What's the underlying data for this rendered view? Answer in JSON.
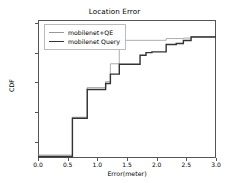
{
  "chart_data": {
    "type": "line",
    "title": "Location Error",
    "xlabel": "Error(meter)",
    "ylabel": "CDF",
    "xlim": [
      0.0,
      3.0
    ],
    "ylim": [
      0.09,
      1.02
    ],
    "grid": false,
    "legend_position": "upper left",
    "xticks": [
      "0.0",
      "0.5",
      "1.0",
      "1.5",
      "2.0",
      "2.5",
      "3.0"
    ],
    "xtick_values": [
      0.0,
      0.5,
      1.0,
      1.5,
      2.0,
      2.5,
      3.0
    ],
    "yticks": [
      "0.2",
      "0.4",
      "0.6",
      "0.8",
      "1.0"
    ],
    "ytick_values": [
      0.2,
      0.4,
      0.6,
      0.8,
      1.0
    ],
    "series": [
      {
        "name": "mobilenet+QE",
        "color": "#999999",
        "linewidth": 0.8,
        "step": "post",
        "x": [
          0.0,
          0.58,
          0.83,
          1.14,
          1.22,
          1.37,
          2.16,
          2.45,
          2.58,
          3.0
        ],
        "y": [
          0.11,
          0.365,
          0.565,
          0.605,
          0.725,
          0.883,
          0.895,
          0.898,
          0.908,
          0.912
        ]
      },
      {
        "name": "mobilenet Query",
        "color": "#333333",
        "linewidth": 1.4,
        "step": "post",
        "x": [
          0.0,
          0.58,
          0.83,
          1.14,
          1.22,
          1.37,
          1.72,
          1.82,
          1.92,
          2.16,
          2.33,
          2.45,
          2.58,
          3.0
        ],
        "y": [
          0.1,
          0.358,
          0.552,
          0.592,
          0.655,
          0.722,
          0.782,
          0.8,
          0.805,
          0.855,
          0.862,
          0.882,
          0.905,
          0.912
        ]
      }
    ]
  },
  "legend": {
    "entries": [
      {
        "label": "mobilenet+QE"
      },
      {
        "label": "mobilenet Query"
      }
    ]
  }
}
